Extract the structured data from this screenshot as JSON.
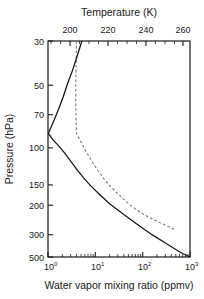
{
  "chart_data": {
    "type": "line",
    "title": "",
    "xlabel": "Water vapor mixing ratio (ppmv)",
    "ylabel": "Pressure (hPa)",
    "x2label": "Temperature (K)",
    "xscale": "log",
    "yscale": "log",
    "xlim": [
      1,
      1000
    ],
    "ylim": [
      500,
      30
    ],
    "x2lim": [
      190,
      270
    ],
    "grid": false,
    "legend": "none",
    "xticks": [
      "10^0",
      "10^1",
      "10^2",
      "10^3"
    ],
    "xtick_values": [
      1,
      10,
      100,
      1000
    ],
    "xtick_mantissa": [
      "10",
      "10",
      "10",
      "10"
    ],
    "xtick_exponent": [
      "0",
      "1",
      "2",
      "3"
    ],
    "yticks": [
      "30",
      "50",
      "70",
      "100",
      "150",
      "200",
      "300",
      "500"
    ],
    "ytick_values": [
      30,
      50,
      70,
      100,
      150,
      200,
      300,
      500
    ],
    "x2ticks": [
      "200",
      "220",
      "240",
      "260"
    ],
    "x2tick_values": [
      200,
      220,
      240,
      260
    ],
    "series": [
      {
        "name": "Water vapor mixing ratio",
        "style": "solid",
        "color": "#1a1a1a",
        "axis": "bottom",
        "points": [
          {
            "x": 5.2,
            "y": 30
          },
          {
            "x": 4.2,
            "y": 36
          },
          {
            "x": 3.3,
            "y": 44
          },
          {
            "x": 2.6,
            "y": 52
          },
          {
            "x": 2.1,
            "y": 62
          },
          {
            "x": 1.7,
            "y": 72
          },
          {
            "x": 1.35,
            "y": 84
          },
          {
            "x": 1.12,
            "y": 94
          },
          {
            "x": 1.02,
            "y": 100
          },
          {
            "x": 1.25,
            "y": 108
          },
          {
            "x": 1.7,
            "y": 118
          },
          {
            "x": 2.3,
            "y": 130
          },
          {
            "x": 3.1,
            "y": 145
          },
          {
            "x": 4.2,
            "y": 162
          },
          {
            "x": 5.6,
            "y": 178
          },
          {
            "x": 8.0,
            "y": 198
          },
          {
            "x": 12.0,
            "y": 220
          },
          {
            "x": 20.0,
            "y": 250
          },
          {
            "x": 38.0,
            "y": 285
          },
          {
            "x": 75.0,
            "y": 325
          },
          {
            "x": 160.0,
            "y": 375
          },
          {
            "x": 340.0,
            "y": 425
          },
          {
            "x": 620.0,
            "y": 470
          },
          {
            "x": 1000.0,
            "y": 500
          }
        ]
      },
      {
        "name": "Temperature profile",
        "style": "dashed",
        "color": "#7a7a7a",
        "axis": "bottom",
        "points": [
          {
            "x": 4.0,
            "y": 30
          },
          {
            "x": 3.95,
            "y": 38
          },
          {
            "x": 3.9,
            "y": 46
          },
          {
            "x": 3.85,
            "y": 55
          },
          {
            "x": 3.85,
            "y": 65
          },
          {
            "x": 3.9,
            "y": 78
          },
          {
            "x": 3.95,
            "y": 90
          },
          {
            "x": 4.0,
            "y": 100
          },
          {
            "x": 5.0,
            "y": 112
          },
          {
            "x": 6.3,
            "y": 126
          },
          {
            "x": 8.0,
            "y": 140
          },
          {
            "x": 9.3,
            "y": 150
          },
          {
            "x": 11.5,
            "y": 163
          },
          {
            "x": 15.0,
            "y": 180
          },
          {
            "x": 21.0,
            "y": 200
          },
          {
            "x": 33.0,
            "y": 225
          },
          {
            "x": 52.0,
            "y": 252
          },
          {
            "x": 90.0,
            "y": 280
          },
          {
            "x": 160.0,
            "y": 305
          },
          {
            "x": 300.0,
            "y": 330
          },
          {
            "x": 480.0,
            "y": 350
          }
        ]
      }
    ]
  },
  "colors": {
    "axis": "#1a1a1a",
    "solid_series": "#1a1a1a",
    "dashed_series": "#7a7a7a",
    "background": "#ffffff"
  }
}
